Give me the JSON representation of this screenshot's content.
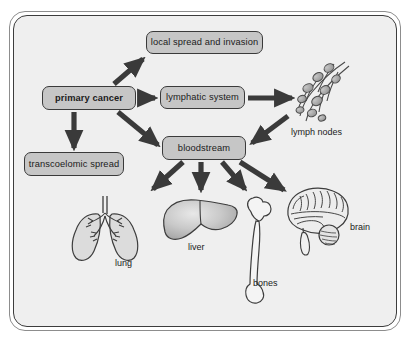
{
  "diagram": {
    "frame": {
      "outer_border_color": "#8d8d8d",
      "inner_border_color": "#3c3c3c",
      "background_color": "#efefef"
    },
    "node_style": {
      "fill_color": "#c6c6c6",
      "stroke_color": "#3a3a3a",
      "text_color": "#1b1b1b"
    },
    "arrow_color": "#3a3a3a",
    "nodes": [
      {
        "id": "primary_cancer",
        "label": "primary cancer",
        "bold": true
      },
      {
        "id": "local_spread",
        "label": "local spread and invasion",
        "bold": false
      },
      {
        "id": "lymphatic_system",
        "label": "lymphatic system",
        "bold": false
      },
      {
        "id": "transcoelomic_spread",
        "label": "transcoelomic spread",
        "bold": false
      },
      {
        "id": "bloodstream",
        "label": "bloodstream",
        "bold": false
      }
    ],
    "illustrations": [
      {
        "id": "lymph_nodes",
        "label": "lymph nodes",
        "icon": "lymph-nodes-icon"
      },
      {
        "id": "lung",
        "label": "lung",
        "icon": "lung-icon"
      },
      {
        "id": "liver",
        "label": "liver",
        "icon": "liver-icon"
      },
      {
        "id": "bones",
        "label": "bones",
        "icon": "femur-bone-icon"
      },
      {
        "id": "brain",
        "label": "brain",
        "icon": "brain-icon"
      }
    ],
    "edges": [
      {
        "from": "primary_cancer",
        "to": "local_spread"
      },
      {
        "from": "primary_cancer",
        "to": "lymphatic_system"
      },
      {
        "from": "primary_cancer",
        "to": "transcoelomic_spread"
      },
      {
        "from": "primary_cancer",
        "to": "bloodstream"
      },
      {
        "from": "lymphatic_system",
        "to": "lymph_nodes"
      },
      {
        "from": "lymph_nodes",
        "to": "bloodstream"
      },
      {
        "from": "bloodstream",
        "to": "lung"
      },
      {
        "from": "bloodstream",
        "to": "liver"
      },
      {
        "from": "bloodstream",
        "to": "bones"
      },
      {
        "from": "bloodstream",
        "to": "brain"
      }
    ]
  }
}
